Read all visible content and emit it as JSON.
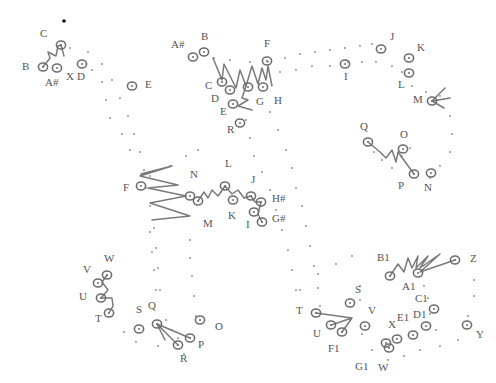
{
  "diagram": {
    "type": "hand-drawn dot trajectory diagram",
    "colors": {
      "ink": "#6e6e6e",
      "dots": "#8a8a8a",
      "labels": "#555555",
      "background": "#ffffff"
    },
    "marker": {
      "x": 64,
      "y": 21
    },
    "groups": [
      {
        "name": "top-left-cluster",
        "labels": [
          {
            "text": "C",
            "x": 40,
            "y": 37
          },
          {
            "text": "B",
            "x": 22,
            "y": 70
          },
          {
            "text": "A#",
            "x": 45,
            "y": 86
          },
          {
            "text": "X",
            "x": 66,
            "y": 80
          },
          {
            "text": "D",
            "x": 77,
            "y": 80
          },
          {
            "text": "E",
            "x": 145,
            "y": 88
          }
        ],
        "rings": [
          [
            43,
            67
          ],
          [
            57,
            68
          ],
          [
            61,
            45
          ],
          [
            82,
            64
          ],
          [
            132,
            86
          ]
        ],
        "strokes": [
          "M43,67 L50,58 L48,52 L56,56 L58,46 L61,45 L64,56"
        ]
      },
      {
        "name": "top-center-cluster",
        "labels": [
          {
            "text": "A#",
            "x": 171,
            "y": 48
          },
          {
            "text": "B",
            "x": 201,
            "y": 40
          },
          {
            "text": "F",
            "x": 264,
            "y": 47
          },
          {
            "text": "C",
            "x": 205,
            "y": 89
          },
          {
            "text": "D",
            "x": 211,
            "y": 102
          },
          {
            "text": "E",
            "x": 220,
            "y": 115
          },
          {
            "text": "G",
            "x": 256,
            "y": 105
          },
          {
            "text": "H",
            "x": 274,
            "y": 104
          },
          {
            "text": "R",
            "x": 227,
            "y": 133
          }
        ],
        "rings": [
          [
            193,
            57
          ],
          [
            204,
            52
          ],
          [
            222,
            82
          ],
          [
            230,
            90
          ],
          [
            248,
            87
          ],
          [
            263,
            87
          ],
          [
            267,
            61
          ],
          [
            233,
            104
          ],
          [
            240,
            123
          ]
        ],
        "strokes": [
          "M213,58 L222,80 L224,64 L236,88 L240,70 L246,86 L252,66 L258,84 L262,68 L266,80 L268,66 L272,86",
          "M246,86 L242,98 L248,100 L238,106 L252,110"
        ]
      },
      {
        "name": "top-right-cluster",
        "labels": [
          {
            "text": "J",
            "x": 390,
            "y": 40
          },
          {
            "text": "K",
            "x": 417,
            "y": 51
          },
          {
            "text": "I",
            "x": 344,
            "y": 80
          },
          {
            "text": "L",
            "x": 398,
            "y": 88
          },
          {
            "text": "M",
            "x": 413,
            "y": 103
          },
          {
            "text": "Q",
            "x": 360,
            "y": 130
          },
          {
            "text": "O",
            "x": 400,
            "y": 138
          },
          {
            "text": "P",
            "x": 398,
            "y": 189
          },
          {
            "text": "N",
            "x": 424,
            "y": 191
          }
        ],
        "rings": [
          [
            381,
            49
          ],
          [
            345,
            64
          ],
          [
            409,
            58
          ],
          [
            409,
            73
          ],
          [
            432,
            101
          ],
          [
            368,
            142
          ],
          [
            403,
            149
          ],
          [
            414,
            174
          ],
          [
            431,
            173
          ]
        ],
        "strokes": [
          "M432,101 L445,88 M432,101 L450,98 M432,101 L444,108",
          "M368,142 L380,152 L386,158 L392,150 L396,162 L398,152 L414,174"
        ]
      },
      {
        "name": "middle-cluster",
        "labels": [
          {
            "text": "F",
            "x": 123,
            "y": 191
          },
          {
            "text": "N",
            "x": 190,
            "y": 178
          },
          {
            "text": "L",
            "x": 225,
            "y": 167
          },
          {
            "text": "J",
            "x": 251,
            "y": 183
          },
          {
            "text": "H#",
            "x": 272,
            "y": 202
          },
          {
            "text": "K",
            "x": 228,
            "y": 219
          },
          {
            "text": "I",
            "x": 246,
            "y": 228
          },
          {
            "text": "G#",
            "x": 272,
            "y": 222
          },
          {
            "text": "M",
            "x": 203,
            "y": 227
          }
        ],
        "rings": [
          [
            141,
            186
          ],
          [
            190,
            196
          ],
          [
            198,
            201
          ],
          [
            225,
            186
          ],
          [
            233,
            200
          ],
          [
            251,
            196
          ],
          [
            261,
            202
          ],
          [
            254,
            212
          ],
          [
            262,
            222
          ]
        ],
        "strokes": [
          "M141,174 L172,166 L140,176 L178,185 L148,188 L186,196 L150,203 L190,216 L152,220",
          "M198,201 L204,192 L208,198 L212,190 L218,196 L225,186 L232,194 L238,190 L244,198 L251,196 L255,202 L261,202 L258,214 L262,222"
        ]
      },
      {
        "name": "bottom-left-cluster",
        "labels": [
          {
            "text": "W",
            "x": 104,
            "y": 262
          },
          {
            "text": "V",
            "x": 83,
            "y": 273
          },
          {
            "text": "U",
            "x": 79,
            "y": 300
          },
          {
            "text": "T",
            "x": 95,
            "y": 322
          },
          {
            "text": "S",
            "x": 136,
            "y": 313
          },
          {
            "text": "Q",
            "x": 148,
            "y": 309
          },
          {
            "text": "O",
            "x": 215,
            "y": 330
          },
          {
            "text": "P",
            "x": 198,
            "y": 348
          },
          {
            "text": "R",
            "x": 180,
            "y": 362
          }
        ],
        "rings": [
          [
            107,
            275
          ],
          [
            98,
            283
          ],
          [
            101,
            298
          ],
          [
            109,
            313
          ],
          [
            139,
            329
          ],
          [
            157,
            324
          ],
          [
            190,
            338
          ],
          [
            178,
            345
          ],
          [
            200,
            320
          ]
        ],
        "strokes": [
          "M107,275 L102,282 L108,290 L101,298 L112,298 L113,306 L109,313",
          "M157,324 L165,340 M157,324 L178,345 M157,324 L190,338"
        ]
      },
      {
        "name": "bottom-right-cluster",
        "labels": [
          {
            "text": "B1",
            "x": 377,
            "y": 261
          },
          {
            "text": "Z",
            "x": 470,
            "y": 262
          },
          {
            "text": "A1",
            "x": 402,
            "y": 290
          },
          {
            "text": "C1",
            "x": 415,
            "y": 302
          },
          {
            "text": "S",
            "x": 355,
            "y": 293
          },
          {
            "text": "T",
            "x": 296,
            "y": 314
          },
          {
            "text": "V",
            "x": 368,
            "y": 314
          },
          {
            "text": "D1",
            "x": 413,
            "y": 318
          },
          {
            "text": "E1",
            "x": 397,
            "y": 321
          },
          {
            "text": "X",
            "x": 388,
            "y": 328
          },
          {
            "text": "U",
            "x": 313,
            "y": 337
          },
          {
            "text": "Y",
            "x": 476,
            "y": 338
          },
          {
            "text": "F1",
            "x": 328,
            "y": 352
          },
          {
            "text": "G1",
            "x": 355,
            "y": 370
          },
          {
            "text": "W",
            "x": 378,
            "y": 371
          }
        ],
        "rings": [
          [
            390,
            276
          ],
          [
            418,
            273
          ],
          [
            455,
            260
          ],
          [
            350,
            303
          ],
          [
            316,
            313
          ],
          [
            331,
            325
          ],
          [
            342,
            332
          ],
          [
            365,
            326
          ],
          [
            434,
            309
          ],
          [
            426,
            326
          ],
          [
            413,
            335
          ],
          [
            397,
            339
          ],
          [
            389,
            348
          ],
          [
            386,
            343
          ],
          [
            467,
            325
          ]
        ],
        "strokes": [
          "M390,276 L398,264 L404,272 L408,258 L412,268 L418,256 L416,268 L428,256 L420,268 L440,254 L420,272 L455,260",
          "M316,313 L352,318 M352,318 L331,325 M352,318 L342,332"
        ]
      }
    ]
  }
}
